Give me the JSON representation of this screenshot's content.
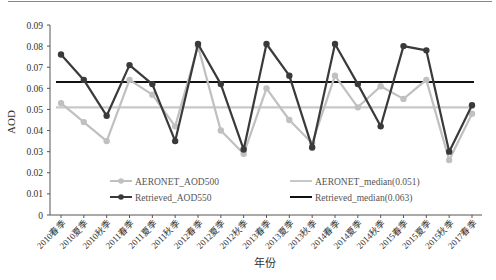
{
  "chart_data": {
    "type": "line",
    "title": "",
    "xlabel": "年份",
    "ylabel": "AOD",
    "ylim": [
      0,
      0.09
    ],
    "yticks": [
      "0",
      "0.01",
      "0.02",
      "0.03",
      "0.04",
      "0.05",
      "0.06",
      "0.07",
      "0.08",
      "0.09"
    ],
    "grid": false,
    "legend_position": "inside-bottom",
    "categories": [
      "2010春季",
      "2010夏季",
      "2010秋季",
      "2011春季",
      "2011夏季",
      "2011秋季",
      "2012春季",
      "2012夏季",
      "2012秋季",
      "2013春季",
      "2013夏季",
      "2013秋季",
      "2014春季",
      "2014夏季",
      "2014秋季",
      "2015春季",
      "2015夏季",
      "2015秋季",
      "2017春季"
    ],
    "series": [
      {
        "name": "AERONET_AOD500",
        "color": "#c0c0c0",
        "marker": true,
        "values": [
          0.053,
          0.044,
          0.035,
          0.064,
          0.057,
          0.042,
          0.08,
          0.04,
          0.029,
          0.06,
          0.045,
          0.034,
          0.066,
          0.051,
          0.061,
          0.055,
          0.064,
          0.026,
          0.048
        ]
      },
      {
        "name": "Retrieved_AOD550",
        "color": "#3a3a3a",
        "marker": true,
        "values": [
          0.076,
          0.064,
          0.047,
          0.071,
          0.062,
          0.035,
          0.081,
          0.062,
          0.031,
          0.081,
          0.066,
          0.032,
          0.081,
          0.062,
          0.042,
          0.08,
          0.078,
          0.03,
          0.052
        ]
      },
      {
        "name": "AERONET_median(0.051)",
        "color": "#c8c8c8",
        "marker": false,
        "constant": 0.051
      },
      {
        "name": "Retrieved_median(0.063)",
        "color": "#111111",
        "marker": false,
        "constant": 0.063
      }
    ]
  }
}
